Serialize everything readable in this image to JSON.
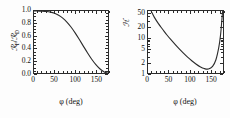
{
  "figure": {
    "background": "#fdfdfd",
    "ink": "#2b2b2b",
    "panel_count": 2
  },
  "chart_data": [
    {
      "type": "line",
      "panel": "left",
      "title": "",
      "xlabel": "φ  (deg)",
      "ylabel_main": "ℛ",
      "ylabel_sub_num": "F",
      "ylabel_slash": "/",
      "ylabel_den": "ℛ",
      "ylabel_sub_den": "D",
      "ylabel_plain": "R_F/R_D",
      "xscale": "linear",
      "yscale": "linear",
      "xlim": [
        0,
        180
      ],
      "ylim": [
        0.0,
        1.0
      ],
      "grid": false,
      "legend": "none",
      "xticks": [
        0,
        50,
        100,
        150
      ],
      "xticklabels": [
        "0",
        "50",
        "100",
        "150"
      ],
      "xminor_step": 10,
      "yticks": [
        0.0,
        0.2,
        0.4,
        0.6,
        0.8,
        1.0
      ],
      "yticklabels": [
        "0.0",
        "0.2",
        "0.4",
        "0.6",
        "0.8",
        "1.0"
      ],
      "yminor_step": 0.05,
      "series": [
        {
          "name": "RF/RD",
          "x": [
            0,
            10,
            20,
            30,
            40,
            50,
            60,
            70,
            80,
            90,
            100,
            110,
            120,
            130,
            140,
            150,
            160,
            170,
            175,
            180
          ],
          "y": [
            1.0,
            0.999,
            0.997,
            0.992,
            0.982,
            0.963,
            0.932,
            0.886,
            0.822,
            0.742,
            0.648,
            0.543,
            0.434,
            0.327,
            0.226,
            0.138,
            0.068,
            0.019,
            0.006,
            0.0
          ]
        }
      ]
    },
    {
      "type": "line",
      "panel": "right",
      "title": "",
      "xlabel": "φ  (deg)",
      "ylabel_main": "ℋ",
      "ylabel_plain": "H",
      "xscale": "linear",
      "yscale": "log",
      "xlim": [
        0,
        180
      ],
      "ylim": [
        1,
        60
      ],
      "grid": false,
      "legend": "none",
      "xticks": [
        0,
        50,
        100,
        150
      ],
      "xticklabels": [
        "0",
        "50",
        "100",
        "150"
      ],
      "xminor_step": 10,
      "yticks": [
        1,
        2,
        5,
        10,
        20,
        50
      ],
      "yticklabels": [
        "1",
        "2",
        "5",
        "10",
        "20",
        "50"
      ],
      "series": [
        {
          "name": "H",
          "x": [
            8,
            15,
            25,
            35,
            45,
            55,
            65,
            75,
            85,
            95,
            105,
            115,
            125,
            135,
            145,
            155,
            163,
            170,
            174,
            177,
            179
          ],
          "y": [
            58,
            40,
            26,
            18,
            12.5,
            9.0,
            6.6,
            4.9,
            3.7,
            2.85,
            2.25,
            1.82,
            1.52,
            1.34,
            1.3,
            1.55,
            2.4,
            5.5,
            12,
            30,
            58
          ]
        }
      ]
    }
  ]
}
